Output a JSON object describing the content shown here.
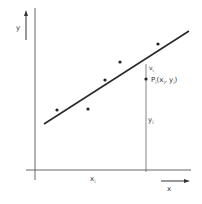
{
  "diagram": {
    "type": "regression-residual-illustration",
    "colors": {
      "background": "#ffffff",
      "line": "#2a2a2a",
      "axis": "#555555",
      "point": "#222222",
      "text": "#333333"
    },
    "axes": {
      "x_label": "x",
      "y_label": "y"
    },
    "regression_line": {
      "from": [
        44,
        124
      ],
      "to": [
        189,
        31
      ]
    },
    "points": [
      {
        "x": 57,
        "y": 110
      },
      {
        "x": 88,
        "y": 109
      },
      {
        "x": 105,
        "y": 80
      },
      {
        "x": 120,
        "y": 62
      },
      {
        "x": 158,
        "y": 44
      },
      {
        "x": 146,
        "y": 79
      }
    ],
    "highlighted_point": {
      "label_main": "P",
      "label_sub": "i",
      "coords_text": "(x",
      "coords_sub1": "i",
      "coords_mid": ", y",
      "coords_sub2": "i",
      "coords_end": ")"
    },
    "annotations": {
      "residual_label": "v",
      "residual_sub": "i",
      "y_i_label": "y",
      "y_i_sub": "i",
      "x_i_label": "x",
      "x_i_sub": "i"
    }
  }
}
